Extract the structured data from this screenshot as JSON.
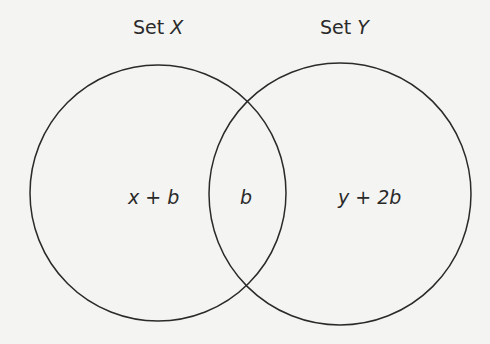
{
  "diagram": {
    "type": "venn",
    "colors": {
      "stroke": "#2a2a2a",
      "background": "#f4f4f2"
    },
    "sets": [
      {
        "name_prefix": "Set",
        "name_var": "X",
        "cx": 158,
        "cy": 193,
        "r": 128
      },
      {
        "name_prefix": "Set",
        "name_var": "Y",
        "cx": 340,
        "cy": 194,
        "r": 131
      }
    ],
    "regions": {
      "only_x": "x + b",
      "intersection": "b",
      "only_y": "y + 2b"
    }
  }
}
